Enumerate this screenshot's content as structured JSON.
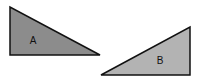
{
  "diagram": {
    "shapes": [
      {
        "id": "A",
        "label": "A",
        "type": "right-triangle",
        "points": [
          [
            10,
            7
          ],
          [
            10,
            55
          ],
          [
            100,
            55
          ]
        ],
        "fill": "#8c8c8c",
        "stroke": "#111111",
        "label_pos": [
          33,
          44
        ]
      },
      {
        "id": "B",
        "label": "B",
        "type": "right-triangle",
        "points": [
          [
            101,
            75
          ],
          [
            190,
            27
          ],
          [
            190,
            75
          ]
        ],
        "fill": "#b3b3b3",
        "stroke": "#111111",
        "label_pos": [
          160,
          64
        ]
      }
    ]
  }
}
